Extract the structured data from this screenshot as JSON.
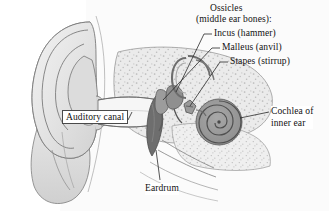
{
  "diagram": {
    "background_color": "#ffffff",
    "ink_color": "#3a3a3a",
    "labels": {
      "ossicles": "Ossicles",
      "middle_ear_bones": "(middle ear bones):",
      "incus": "Incus (hammer)",
      "malleus": "Malleus (anvil)",
      "stapes": "Stapes (stirrup)",
      "cochlea_line1": "Cochlea of",
      "cochlea_line2": "inner ear",
      "auditory_canal": "Auditory canal",
      "eardrum": "Eardrum"
    }
  }
}
